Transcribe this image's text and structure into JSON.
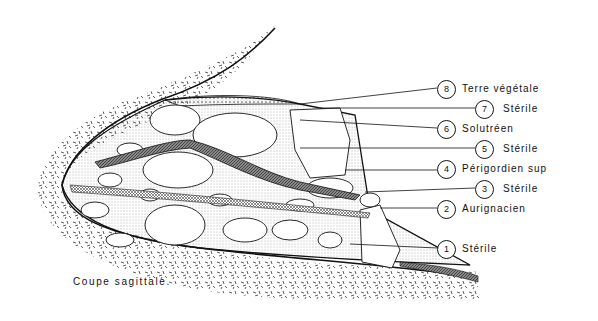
{
  "figure": {
    "caption": "Coupe sagittale.",
    "type": "archaeological stratigraphic section"
  },
  "layers": [
    {
      "number": "8",
      "label": "Terre végétale",
      "pattern": "dotted"
    },
    {
      "number": "7",
      "label": "Stérile",
      "pattern": "blocks"
    },
    {
      "number": "6",
      "label": "Solutréen",
      "pattern": "dark-lens"
    },
    {
      "number": "5",
      "label": "Stérile",
      "pattern": "blocks"
    },
    {
      "number": "4",
      "label": "Périgordien sup",
      "pattern": "hatched-band"
    },
    {
      "number": "3",
      "label": "Stérile",
      "pattern": "blocks"
    },
    {
      "number": "2",
      "label": "Aurignacien",
      "pattern": "cross-hatched-band"
    },
    {
      "number": "1",
      "label": "Stérile",
      "pattern": "blocks"
    }
  ]
}
